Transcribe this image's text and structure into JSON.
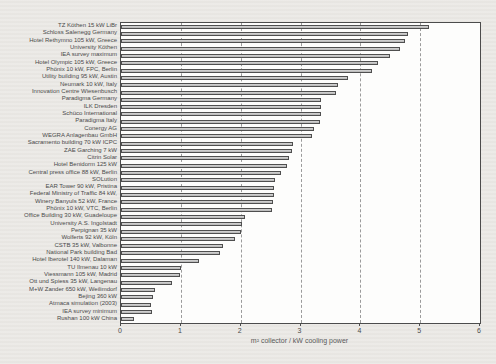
{
  "chart_data": {
    "type": "bar",
    "orientation": "horizontal",
    "title": "",
    "xlabel": "m² collector / kW cooling power",
    "ylabel": "",
    "xlim": [
      0,
      6
    ],
    "x_ticks": [
      0,
      1,
      2,
      3,
      4,
      5,
      6
    ],
    "grid": "vertical dashed lines at integer ticks 1-5",
    "legend": "none",
    "bar_fill_color": "#c6c6c6",
    "bar_border_color": "#4f4f4f",
    "categories": [
      "TZ Köthen 15 kW LiBr",
      "Schloss Salenegg Germany",
      "Hotel Rethymno 105 kW, Greece",
      "University Köthen",
      "IEA survey maximum",
      "Hotel Olympic 105 kW, Greece",
      "Phönix 10 kW, FPC, Berlin",
      "Utility building 95 kW, Austin",
      "Neumark 10 kW, Italy",
      "Innovation Centre Wiesenbusch",
      "Paradigma Germany",
      "ILK Dresden",
      "Schüco International",
      "Paradigma Italy",
      "Conergy AG",
      "WEGRA Anlagenbau GmbH",
      "Sacramento building 70 kW ICPC",
      "ZAE Garching 7 kW",
      "Citrin Solar",
      "Hotel Benidorm 125 kW",
      "Central press office 88 kW, Berlin",
      "SOLution",
      "EAR Tower 90 kW, Pristina",
      "Federal Ministry of Traffic 84 kW,",
      "Winery Banyuls 52 kW, France",
      "Phönix 10 kW, VTC, Berlin",
      "Office Building 30 kW, Guadeloupe",
      "University A.S. Ingolstadt",
      "Perpignan 35 kW",
      "Wolferts 92 kW, Köln",
      "CSTB 35 kW, Valbonne",
      "National Park building Bad",
      "Hotel Iberotel 140 kW, Dalaman",
      "TU Ilmenau 10 kW",
      "Viessmann 105 kW, Madrid",
      "Ott und Spiess 35 kW, Langenau",
      "M+W Zander 650 kW, Weilimdorf",
      "Bejing 360 kW",
      "Atmaca simulation (2003)",
      "IEA survey minimum",
      "Rushan 100 kW China"
    ],
    "values": [
      5.15,
      4.8,
      4.75,
      4.67,
      4.5,
      4.3,
      4.2,
      3.8,
      3.63,
      3.6,
      3.35,
      3.35,
      3.35,
      3.33,
      3.22,
      3.2,
      2.88,
      2.85,
      2.8,
      2.78,
      2.67,
      2.57,
      2.56,
      2.55,
      2.54,
      2.52,
      2.07,
      2.02,
      2.0,
      1.9,
      1.7,
      1.66,
      1.3,
      1.0,
      0.99,
      0.85,
      0.56,
      0.53,
      0.5,
      0.51,
      0.22
    ]
  }
}
